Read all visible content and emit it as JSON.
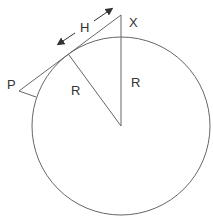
{
  "diagram": {
    "labels": {
      "x_point": "X",
      "p_point": "P",
      "h_distance": "H",
      "radius_slanted": "R",
      "radius_vertical": "R"
    },
    "colors": {
      "stroke": "#555555",
      "text": "#333333",
      "background": "#ffffff"
    },
    "geometry": {
      "circle": {
        "cx": 121,
        "cy": 126,
        "r": 89
      },
      "point_x": [
        121,
        15
      ],
      "tangent_point": [
        69,
        55
      ],
      "point_p": [
        19,
        91
      ]
    }
  }
}
